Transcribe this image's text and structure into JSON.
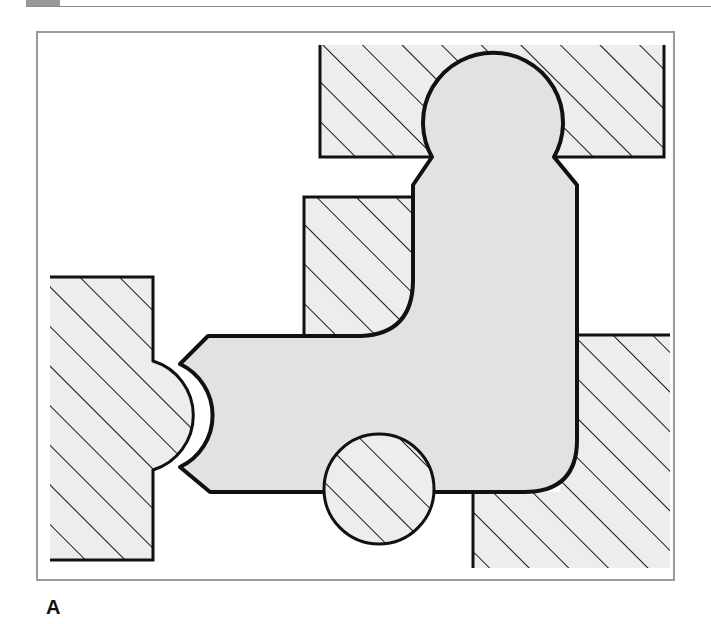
{
  "figure": {
    "label": "A",
    "colors": {
      "background": "#ffffff",
      "frame_border": "#9a9a9a",
      "hatch_fill": "#ededed",
      "hatch_line": "#1a1a1a",
      "part_fill": "#e2e2e2",
      "outline": "#111111",
      "header_tab": "#9a9a9a"
    }
  }
}
